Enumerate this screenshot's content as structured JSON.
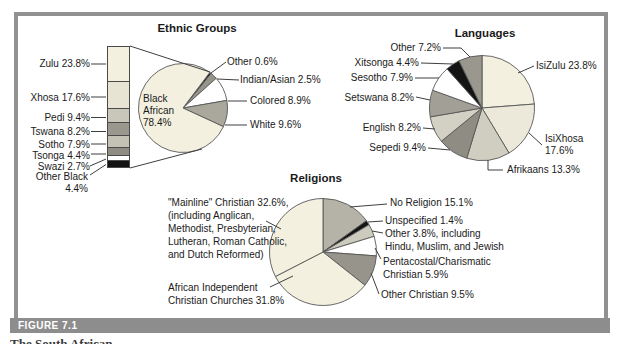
{
  "figure": {
    "label": "FIGURE 7.1",
    "caption_fragment": "The South African"
  },
  "styles": {
    "frame_color": "#919191",
    "figure_bar_color": "#8d8d8d",
    "leader_line_color": "#3f3f3f",
    "text_color": "#1a1a1a"
  },
  "chart_data": [
    {
      "id": "ethnic-groups",
      "type": "pie",
      "title": "Ethnic Groups",
      "start_angle": 37,
      "labels": [
        "Other",
        "Indian/Asian",
        "Colored",
        "White",
        "Black African"
      ],
      "values": [
        0.6,
        2.5,
        8.9,
        9.6,
        78.4
      ],
      "colors": [
        "#141414",
        "#97958b",
        "#ffffff",
        "#aaa89c",
        "#f3f0e0"
      ],
      "annotations": {
        "center": "Black\nAfrican\n78.4%",
        "other": "Other 0.6%",
        "indian_asian": "Indian/Asian 2.5%",
        "colored": "Colored 8.9%",
        "white": "White 9.6%"
      },
      "breakdown_bar": {
        "type": "bar",
        "note": "stacked bar breaking down the Black African 78.4% slice",
        "labels": [
          "Zulu",
          "Xhosa",
          "Pedi",
          "Tswana",
          "Sotho",
          "Tsonga",
          "Swazi",
          "Other Black"
        ],
        "values": [
          23.8,
          17.6,
          9.4,
          8.2,
          7.9,
          4.4,
          2.7,
          4.4
        ],
        "colors": [
          "#f3f0e0",
          "#e7e4d4",
          "#c9c7b9",
          "#9a988e",
          "#c4c2b4",
          "#8f8d83",
          "#ffffff",
          "#141414"
        ],
        "display_labels": [
          "Zulu 23.8%",
          "Xhosa 17.6%",
          "Pedi 9.4%",
          "Tswana 8.2%",
          "Sotho 7.9%",
          "Tsonga 4.4%",
          "Swazi 2.7%",
          "Other Black\n4.4%"
        ]
      }
    },
    {
      "id": "languages",
      "type": "pie",
      "title": "Languages",
      "start_angle": 0,
      "labels": [
        "IsiZulu",
        "IsiXhosa",
        "Afrikaans",
        "Sepedi",
        "English",
        "Setswana",
        "Sesotho",
        "Xitsonga",
        "Other"
      ],
      "values": [
        23.8,
        17.6,
        13.3,
        9.4,
        8.2,
        8.2,
        7.9,
        4.4,
        7.2
      ],
      "colors": [
        "#f3f0e0",
        "#ece9db",
        "#d0cec0",
        "#8f8d83",
        "#d3d1c3",
        "#a2a096",
        "#ffffff",
        "#141414",
        "#9a988e"
      ],
      "display_labels": {
        "isizulu": "IsiZulu 23.8%",
        "isixhosa": "IsiXhosa\n17.6%",
        "afrikaans": "Afrikaans 13.3%",
        "sepedi": "Sepedi 9.4%",
        "english": "English 8.2%",
        "setswana": "Setswana 8.2%",
        "sesotho": "Sesotho 7.9%",
        "xitsonga": "Xitsonga 4.4%",
        "other": "Other 7.2%"
      }
    },
    {
      "id": "religions",
      "type": "pie",
      "title": "Religions",
      "start_angle": 0,
      "labels": [
        "No Religion",
        "Unspecified",
        "Other (Hindu, Muslim, Jewish)",
        "Pentacostal/Charismatic Christian",
        "Other Christian",
        "African Independent Christian Churches",
        "Mainline Christian"
      ],
      "values": [
        15.1,
        1.4,
        3.8,
        5.9,
        9.5,
        31.8,
        32.6
      ],
      "colors": [
        "#b5b3a7",
        "#141414",
        "#cdcbbd",
        "#ffffff",
        "#97958b",
        "#f3f0e0",
        "#f3f0e0"
      ],
      "display_labels": {
        "no_religion": "No Religion 15.1%",
        "unspecified": "Unspecified 1.4%",
        "other": "Other 3.8%, including\nHindu, Muslim, and Jewish",
        "pentacostal": "Pentacostal/Charismatic\nChristian 5.9%",
        "other_christian": "Other Christian 9.5%",
        "african_independent": "African Independent\nChristian Churches 31.8%",
        "mainline": "\"Mainline\" Christian 32.6%,\n(including Anglican,\nMethodist, Presbyterian,\nLutheran, Roman Catholic,\nand Dutch Reformed)"
      }
    }
  ]
}
